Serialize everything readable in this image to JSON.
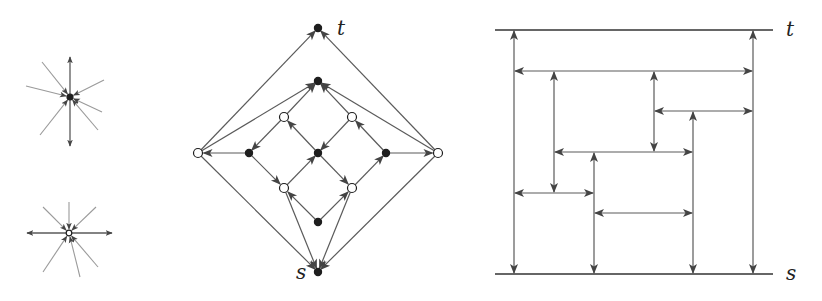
{
  "colors": {
    "stroke": "#5a5a5a",
    "light_stroke": "#9a9a9a",
    "arrow": "#444444",
    "node_fill": "#1e1e1e",
    "open_fill": "#ffffff",
    "text": "#222222"
  },
  "left_stars": [
    {
      "name": "star-filled-center",
      "center": [
        70,
        97
      ],
      "center_type": "filled",
      "out_edges": [
        [
          70,
          57
        ],
        [
          70,
          146
        ]
      ],
      "in_edges": [
        [
          42,
          62
        ],
        [
          26,
          86
        ],
        [
          104,
          80
        ],
        [
          40,
          135
        ],
        [
          102,
          112
        ],
        [
          98,
          130
        ]
      ]
    },
    {
      "name": "star-open-center",
      "center": [
        69,
        233
      ],
      "center_type": "open",
      "out_edges": [
        [
          27,
          233
        ],
        [
          112,
          233
        ]
      ],
      "in_edges": [
        [
          43,
          207
        ],
        [
          69,
          202
        ],
        [
          96,
          207
        ],
        [
          43,
          272
        ],
        [
          80,
          277
        ],
        [
          98,
          267
        ]
      ]
    }
  ],
  "middle_graph": {
    "labels": {
      "t": "t",
      "s": "s"
    },
    "label_positions": {
      "t": [
        337,
        35
      ],
      "s": [
        296,
        279
      ]
    },
    "nodes": [
      {
        "id": "t",
        "x": 318,
        "y": 28,
        "type": "filled"
      },
      {
        "id": "top",
        "x": 318,
        "y": 81,
        "type": "filled"
      },
      {
        "id": "ul",
        "x": 284,
        "y": 117,
        "type": "open"
      },
      {
        "id": "ur",
        "x": 352,
        "y": 117,
        "type": "open"
      },
      {
        "id": "lo",
        "x": 198,
        "y": 153,
        "type": "open"
      },
      {
        "id": "lf",
        "x": 249,
        "y": 153,
        "type": "filled"
      },
      {
        "id": "c",
        "x": 318,
        "y": 153,
        "type": "filled"
      },
      {
        "id": "rf",
        "x": 386,
        "y": 153,
        "type": "filled"
      },
      {
        "id": "ro",
        "x": 438,
        "y": 153,
        "type": "open"
      },
      {
        "id": "ll",
        "x": 284,
        "y": 188,
        "type": "open"
      },
      {
        "id": "lr",
        "x": 352,
        "y": 188,
        "type": "open"
      },
      {
        "id": "b",
        "x": 318,
        "y": 222,
        "type": "filled"
      },
      {
        "id": "s",
        "x": 318,
        "y": 272,
        "type": "filled"
      }
    ],
    "edges": [
      [
        "lo",
        "t"
      ],
      [
        "ro",
        "t"
      ],
      [
        "lo",
        "top"
      ],
      [
        "ro",
        "top"
      ],
      [
        "ul",
        "top"
      ],
      [
        "ur",
        "top"
      ],
      [
        "c",
        "ul"
      ],
      [
        "rf",
        "ur"
      ],
      [
        "ul",
        "lf"
      ],
      [
        "ur",
        "c"
      ],
      [
        "lf",
        "lo"
      ],
      [
        "rf",
        "ro"
      ],
      [
        "lf",
        "ll"
      ],
      [
        "c",
        "lr"
      ],
      [
        "ll",
        "c"
      ],
      [
        "lr",
        "rf"
      ],
      [
        "b",
        "ll"
      ],
      [
        "b",
        "lr"
      ],
      [
        "ll",
        "s"
      ],
      [
        "lr",
        "s"
      ],
      [
        "lo",
        "s"
      ],
      [
        "ro",
        "s"
      ]
    ]
  },
  "right_diagram": {
    "labels": {
      "t": "t",
      "s": "s"
    },
    "label_positions": {
      "t": [
        786,
        36
      ],
      "s": [
        786,
        280
      ]
    },
    "top_line": {
      "y": 30,
      "x1": 495,
      "x2": 773
    },
    "bottom_line": {
      "y": 274,
      "x1": 495,
      "x2": 773
    },
    "verticals": [
      {
        "x": 514,
        "y1": 30,
        "y2": 274,
        "arrows": "both"
      },
      {
        "x": 554,
        "y1": 71,
        "y2": 193,
        "arrows": "both"
      },
      {
        "x": 594,
        "y1": 152,
        "y2": 274,
        "arrows": "both"
      },
      {
        "x": 654,
        "y1": 71,
        "y2": 152,
        "arrows": "both"
      },
      {
        "x": 693,
        "y1": 111,
        "y2": 274,
        "arrows": "both"
      },
      {
        "x": 753,
        "y1": 30,
        "y2": 274,
        "arrows": "both"
      }
    ],
    "horizontals": [
      {
        "y": 71,
        "x1": 514,
        "x2": 753
      },
      {
        "y": 111,
        "x1": 654,
        "x2": 753
      },
      {
        "y": 152,
        "x1": 554,
        "x2": 693
      },
      {
        "y": 193,
        "x1": 514,
        "x2": 594
      },
      {
        "y": 213,
        "x1": 594,
        "x2": 693
      }
    ]
  }
}
